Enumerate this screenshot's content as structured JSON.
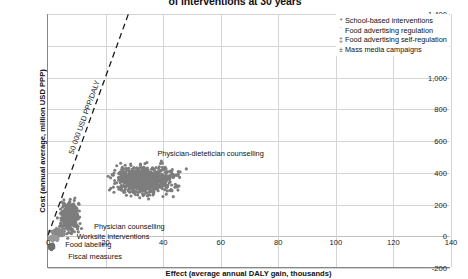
{
  "chart_data": {
    "type": "scatter",
    "title": "of interventions at 30 years",
    "xlabel": "Effect (average annual DALY gain, thousands)",
    "ylabel": "Cost (annual average, million USD PPP)",
    "xlim": [
      0,
      140
    ],
    "ylim": [
      -200,
      1400
    ],
    "xticks": [
      "0",
      "20",
      "40",
      "60",
      "80",
      "100",
      "120",
      "140"
    ],
    "yticks": [
      "1,400",
      "1,200",
      "1,000",
      "800",
      "600",
      "400",
      "200",
      "0",
      "-200"
    ],
    "grid": true,
    "legend_position": "top-right",
    "legend": [
      {
        "marker": "*",
        "label": "School-based interventions"
      },
      {
        "marker": "˙",
        "label": "Food advertising regulation"
      },
      {
        "marker": "‡",
        "label": "Food advertising self-regulation"
      },
      {
        "marker": "±",
        "label": "Mass media campaigns"
      }
    ],
    "reference_line": {
      "label": "50 000 USD PPP/DALY",
      "style": "dashed",
      "from": [
        0,
        0
      ],
      "to": [
        28,
        1400
      ]
    },
    "annotations": [
      {
        "text": "Physician-dietetician counselling",
        "x": 38,
        "y": 520
      },
      {
        "text": "Physician counselling",
        "x": 16,
        "y": 60
      },
      {
        "text": "Worksite interventions",
        "x": 10,
        "y": -5
      },
      {
        "text": "Food labelling",
        "x": 6,
        "y": -55
      },
      {
        "text": "Fiscal measures",
        "x": 7,
        "y": -130
      }
    ],
    "series": [
      {
        "name": "Physician-dietetician counselling",
        "color": "#7d7d7d",
        "center": [
          34,
          350
        ],
        "spread": [
          11,
          95
        ],
        "n": 900
      },
      {
        "name": "Physician counselling",
        "color": "#7d7d7d",
        "center": [
          7.5,
          120
        ],
        "spread": [
          3.2,
          100
        ],
        "n": 420
      },
      {
        "name": "Worksite interventions",
        "color": "#8a8a8a",
        "center": [
          3.2,
          15
        ],
        "spread": [
          2.0,
          22
        ],
        "n": 160
      },
      {
        "name": "Food labelling",
        "color": "#9a9a9a",
        "center": [
          2.0,
          -18
        ],
        "spread": [
          1.6,
          14
        ],
        "n": 110
      },
      {
        "name": "Fiscal measures",
        "color": "#6f6f6f",
        "center": [
          1.2,
          -70
        ],
        "spread": [
          1.0,
          16
        ],
        "n": 80
      }
    ]
  }
}
